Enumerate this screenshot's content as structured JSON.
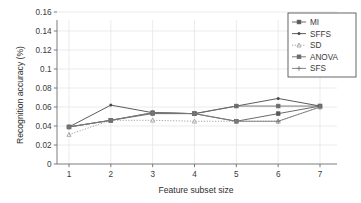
{
  "chart_data": {
    "type": "line",
    "title": "",
    "xlabel": "Feature subset size",
    "ylabel": "Recognition accuracy (%)",
    "x": [
      1,
      2,
      3,
      4,
      5,
      6,
      7
    ],
    "xlim": [
      0.6,
      7.4
    ],
    "ylim": [
      0,
      0.17
    ],
    "xticks": [
      "1",
      "2",
      "3",
      "4",
      "5",
      "6",
      "7"
    ],
    "yticks": [
      "0",
      "0.02",
      "0.04",
      "0.06",
      "0.08",
      "0.1",
      "0.12",
      "0.14",
      "0.16"
    ],
    "ytick_values": [
      0,
      0.02,
      0.04,
      0.06,
      0.08,
      0.1,
      0.12,
      0.14,
      0.16
    ],
    "grid": true,
    "legend_position": "upper right",
    "series": [
      {
        "name": "MI",
        "marker": "square",
        "linestyle": "solid",
        "color": "#5a5a5a",
        "values": [
          0.039,
          0.046,
          0.054,
          0.053,
          0.045,
          0.053,
          0.061
        ]
      },
      {
        "name": "SFFS",
        "marker": "dot",
        "linestyle": "solid",
        "color": "#4a4a4a",
        "values": [
          0.039,
          0.062,
          0.054,
          0.053,
          0.061,
          0.069,
          0.061
        ]
      },
      {
        "name": "SD",
        "marker": "triangle",
        "linestyle": "dotted",
        "color": "#9a9a9a",
        "values": [
          0.031,
          0.046,
          0.046,
          0.045,
          0.045,
          0.045,
          0.06
        ]
      },
      {
        "name": "ANOVA",
        "marker": "square",
        "linestyle": "solid",
        "color": "#6b6b6b",
        "values": [
          0.039,
          0.046,
          0.053,
          0.053,
          0.061,
          0.061,
          0.061
        ]
      },
      {
        "name": "SFS",
        "marker": "plus",
        "linestyle": "solid",
        "color": "#787878",
        "values": [
          0.039,
          0.046,
          0.054,
          0.053,
          0.045,
          0.045,
          0.06
        ]
      }
    ]
  },
  "axes": {
    "xlabel": "Feature subset size",
    "ylabel": "Recognition accuracy (%)"
  },
  "legend": {
    "items": [
      {
        "label": "MI"
      },
      {
        "label": "SFFS"
      },
      {
        "label": "SD"
      },
      {
        "label": "ANOVA"
      },
      {
        "label": "SFS"
      }
    ]
  }
}
